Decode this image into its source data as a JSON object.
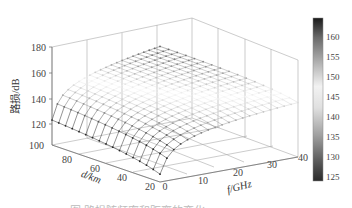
{
  "chart_data": {
    "type": "surface3d",
    "title": "",
    "zlabel": "路损/dB",
    "xlabel": "f/GHz",
    "ylabel": "d/km",
    "x_ticks": [
      "0",
      "10",
      "20",
      "30",
      "40"
    ],
    "y_ticks": [
      "20",
      "40",
      "60",
      "80",
      "100"
    ],
    "z_ticks": [
      "100",
      "120",
      "140",
      "160",
      "180"
    ],
    "xlim": [
      0,
      40
    ],
    "ylim": [
      20,
      100
    ],
    "zlim": [
      100,
      180
    ],
    "x": [
      0,
      40
    ],
    "y": [
      20,
      100
    ],
    "surface_samples": [
      {
        "f": 0,
        "d": 20,
        "loss": 125
      },
      {
        "f": 40,
        "d": 20,
        "loss": 150
      },
      {
        "f": 0,
        "d": 100,
        "loss": 140
      },
      {
        "f": 40,
        "d": 100,
        "loss": 163
      }
    ],
    "colorbar": {
      "ticks": [
        "125",
        "130",
        "135",
        "140",
        "145",
        "150",
        "155",
        "160"
      ],
      "range": [
        124,
        163
      ],
      "colormap": "gray (dark at extremes, light mid)"
    },
    "grid": true,
    "legend": "none"
  },
  "caption": "图  路损随频率和距离的变化"
}
